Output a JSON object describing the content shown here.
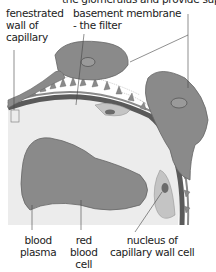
{
  "diagram": {
    "top_caption": "the glomerulus and provide support",
    "labels": {
      "fenestrated_wall": [
        "fenestrated",
        "wall of",
        "capillary"
      ],
      "basement_membrane": [
        "basement membrane",
        "- the filter"
      ],
      "blood_plasma": [
        "blood",
        "plasma"
      ],
      "red_blood_cell": [
        "red",
        "blood",
        "cell"
      ],
      "nucleus": [
        "nucleus of",
        "capillary wall cell"
      ]
    },
    "colors": {
      "cell_fill": "#8a8a8a",
      "cell_stroke": "#666666",
      "membrane": "#555555",
      "plasma": "#ececec",
      "endothelial": "#c4c4c4",
      "leader_line": "#444444"
    }
  }
}
